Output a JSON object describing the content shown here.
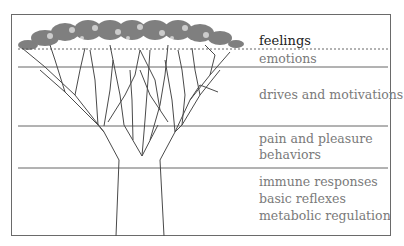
{
  "diagram": {
    "type": "layered tree metaphor",
    "layers": [
      {
        "id": "feelings",
        "label": "feelings",
        "separator": "dashed"
      },
      {
        "id": "emotions",
        "label": "emotions",
        "separator": "solid"
      },
      {
        "id": "drives",
        "label": "drives and motivations",
        "separator": "solid"
      },
      {
        "id": "pain-pleasure",
        "lines": [
          "pain and pleasure",
          "behaviors"
        ],
        "separator": "solid"
      },
      {
        "id": "basic",
        "lines": [
          "immune responses",
          "basic reflexes",
          "metabolic regulation"
        ]
      }
    ],
    "colors": {
      "frame": "#6a6a6a",
      "line": "#555555",
      "label": "#7a7a7a",
      "label_top": "#222222"
    }
  }
}
